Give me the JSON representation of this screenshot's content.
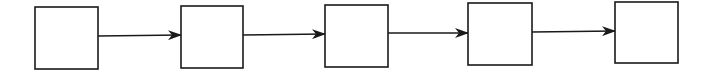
{
  "diagram": {
    "type": "linear-flow",
    "stroke_color": "#1a1a1a",
    "fill_color": "#ffffff",
    "nodes": [
      {
        "id": "box-1",
        "label": "",
        "x": 35,
        "y": 7,
        "w": 63,
        "h": 62
      },
      {
        "id": "box-2",
        "label": "",
        "x": 181,
        "y": 6,
        "w": 62,
        "h": 62
      },
      {
        "id": "box-3",
        "label": "",
        "x": 325,
        "y": 5,
        "w": 63,
        "h": 62
      },
      {
        "id": "box-4",
        "label": "",
        "x": 468,
        "y": 3,
        "w": 64,
        "h": 62
      },
      {
        "id": "box-5",
        "label": "",
        "x": 615,
        "y": 2,
        "w": 63,
        "h": 61
      }
    ],
    "edges": [
      {
        "from": "box-1",
        "to": "box-2",
        "x1": 98,
        "y1": 36,
        "x2": 181,
        "y2": 35
      },
      {
        "from": "box-2",
        "to": "box-3",
        "x1": 243,
        "y1": 35,
        "x2": 325,
        "y2": 34
      },
      {
        "from": "box-3",
        "to": "box-4",
        "x1": 388,
        "y1": 33,
        "x2": 468,
        "y2": 33
      },
      {
        "from": "box-4",
        "to": "box-5",
        "x1": 532,
        "y1": 32,
        "x2": 615,
        "y2": 31
      }
    ]
  }
}
